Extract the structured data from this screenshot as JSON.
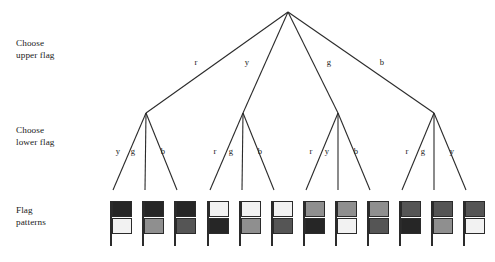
{
  "diagram": {
    "row_labels": [
      {
        "id": "upper",
        "line1": "Choose",
        "line2": "upper flag",
        "text": "Choose\nupper flag"
      },
      {
        "id": "lower",
        "line1": "Choose",
        "line2": "lower flag",
        "text": "Choose\nlower flag"
      },
      {
        "id": "flags",
        "line1": "Flag",
        "line2": "patterns",
        "text": "Flag\npatterns"
      }
    ],
    "root": {
      "x": 288,
      "y": 12
    },
    "colors": {
      "r": "#262626",
      "y": "#f2f2f2",
      "g": "#8f8f8f",
      "b": "#555555",
      "ink": "#1a1a1a",
      "line": "#2b2b2b",
      "background": "#ffffff"
    },
    "color_names": {
      "r": "r",
      "y": "y",
      "g": "g",
      "b": "b"
    },
    "level1_edges": [
      {
        "label": "r",
        "label_x": 196,
        "label_y": 62,
        "to_x": 146,
        "to_y": 113
      },
      {
        "label": "y",
        "label_x": 247,
        "label_y": 62,
        "to_x": 243,
        "to_y": 113
      },
      {
        "label": "g",
        "label_x": 329,
        "label_y": 62,
        "to_x": 338,
        "to_y": 113
      },
      {
        "label": "b",
        "label_x": 382,
        "label_y": 62,
        "to_x": 434,
        "to_y": 113
      }
    ],
    "subtrees": [
      {
        "upper": "r",
        "node_x": 146,
        "node_y": 113,
        "children": [
          {
            "label": "y",
            "label_x": 118,
            "label_y": 151,
            "leaf_x": 113,
            "leaf_y": 190
          },
          {
            "label": "g",
            "label_x": 133,
            "label_y": 151,
            "leaf_x": 145,
            "leaf_y": 190
          },
          {
            "label": "b",
            "label_x": 163,
            "label_y": 151,
            "leaf_x": 177,
            "leaf_y": 190
          }
        ]
      },
      {
        "upper": "y",
        "node_x": 243,
        "node_y": 113,
        "children": [
          {
            "label": "r",
            "label_x": 215,
            "label_y": 151,
            "leaf_x": 210,
            "leaf_y": 190
          },
          {
            "label": "g",
            "label_x": 231,
            "label_y": 151,
            "leaf_x": 242,
            "leaf_y": 190
          },
          {
            "label": "b",
            "label_x": 260,
            "label_y": 151,
            "leaf_x": 274,
            "leaf_y": 190
          }
        ]
      },
      {
        "upper": "g",
        "node_x": 338,
        "node_y": 113,
        "children": [
          {
            "label": "r",
            "label_x": 311,
            "label_y": 151,
            "leaf_x": 306,
            "leaf_y": 190
          },
          {
            "label": "y",
            "label_x": 327,
            "label_y": 151,
            "leaf_x": 338,
            "leaf_y": 190
          },
          {
            "label": "b",
            "label_x": 356,
            "label_y": 151,
            "leaf_x": 370,
            "leaf_y": 190
          }
        ]
      },
      {
        "upper": "b",
        "node_x": 434,
        "node_y": 113,
        "children": [
          {
            "label": "r",
            "label_x": 407,
            "label_y": 151,
            "leaf_x": 402,
            "leaf_y": 190
          },
          {
            "label": "g",
            "label_x": 423,
            "label_y": 151,
            "leaf_x": 434,
            "leaf_y": 190
          },
          {
            "label": "y",
            "label_x": 452,
            "label_y": 151,
            "leaf_x": 466,
            "leaf_y": 190
          }
        ]
      }
    ],
    "flags": [
      {
        "index": 1,
        "upper": "r",
        "lower": "y",
        "x": 110,
        "y": 201
      },
      {
        "index": 2,
        "upper": "r",
        "lower": "g",
        "x": 142,
        "y": 201
      },
      {
        "index": 3,
        "upper": "r",
        "lower": "b",
        "x": 174,
        "y": 201
      },
      {
        "index": 4,
        "upper": "y",
        "lower": "r",
        "x": 207,
        "y": 201
      },
      {
        "index": 5,
        "upper": "y",
        "lower": "g",
        "x": 239,
        "y": 201
      },
      {
        "index": 6,
        "upper": "y",
        "lower": "b",
        "x": 271,
        "y": 201
      },
      {
        "index": 7,
        "upper": "g",
        "lower": "r",
        "x": 303,
        "y": 201
      },
      {
        "index": 8,
        "upper": "g",
        "lower": "y",
        "x": 335,
        "y": 201
      },
      {
        "index": 9,
        "upper": "g",
        "lower": "b",
        "x": 367,
        "y": 201
      },
      {
        "index": 10,
        "upper": "b",
        "lower": "r",
        "x": 399,
        "y": 201
      },
      {
        "index": 11,
        "upper": "b",
        "lower": "g",
        "x": 431,
        "y": 201
      },
      {
        "index": 12,
        "upper": "b",
        "lower": "y",
        "x": 463,
        "y": 201
      }
    ]
  }
}
